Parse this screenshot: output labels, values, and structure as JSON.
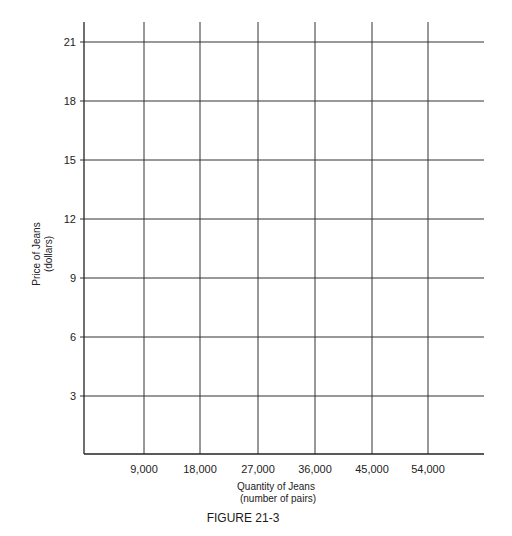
{
  "chart_data": {
    "type": "line",
    "title": "FIGURE 21-3",
    "xlabel": "Quantity of Jeans\n(number of pairs)",
    "xlabel_lines": [
      "Quantity of Jeans",
      "(number of pairs)"
    ],
    "ylabel": "Price of Jeans\n(dollars)",
    "ylabel_lines": [
      "Price of Jeans",
      "(dollars)"
    ],
    "x_ticks": [
      9000,
      18000,
      27000,
      36000,
      45000,
      54000
    ],
    "x_tick_labels": [
      "9,000",
      "18,000",
      "27,000",
      "36,000",
      "45,000",
      "54,000"
    ],
    "y_ticks": [
      3,
      6,
      9,
      12,
      15,
      18,
      21
    ],
    "y_tick_labels": [
      "3",
      "6",
      "9",
      "12",
      "15",
      "18",
      "21"
    ],
    "xlim": [
      0,
      63000
    ],
    "ylim": [
      0,
      22
    ],
    "grid": true,
    "legend": null,
    "series": []
  },
  "layout": {
    "plot_left": 84,
    "plot_right": 484,
    "plot_top": 22,
    "plot_bottom": 454,
    "x_tick_px": [
      144,
      200,
      258,
      315,
      372,
      428
    ],
    "y_tick_px": [
      396,
      337,
      278,
      219,
      160,
      101,
      42
    ],
    "line_color": "#333333"
  },
  "caption": "FIGURE 21-3"
}
